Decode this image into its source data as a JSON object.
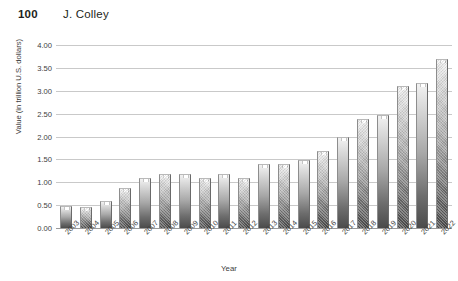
{
  "header": {
    "page_number": "100",
    "author": "J. Colley"
  },
  "chart_data": {
    "type": "bar",
    "title": "",
    "xlabel": "Year",
    "ylabel": "Value (in trillion U.S. dollars)",
    "categories": [
      "2003",
      "2004",
      "2005",
      "2006",
      "2007",
      "2008",
      "2009",
      "2010",
      "2011",
      "2012",
      "2013",
      "2014",
      "2015",
      "2016",
      "2017",
      "2018",
      "2019",
      "2020",
      "2021",
      "2022"
    ],
    "values": [
      0.48,
      0.47,
      0.58,
      0.88,
      1.09,
      1.19,
      1.19,
      1.09,
      1.19,
      1.09,
      1.39,
      1.39,
      1.48,
      1.68,
      1.98,
      2.38,
      2.48,
      3.11,
      3.18,
      3.69
    ],
    "ylim": [
      0,
      4.0
    ],
    "ytick_labels": [
      "4.00",
      "3.50",
      "3.00",
      "2.50",
      "2.00",
      "1.50",
      "1.00",
      "0.50",
      "0.00"
    ],
    "ytick_values": [
      4.0,
      3.5,
      3.0,
      2.5,
      2.0,
      1.5,
      1.0,
      0.5,
      0.0
    ],
    "grid": true,
    "legend": "none",
    "bar_fill": "grayscale-vertical-gradient",
    "colors": {
      "gridline": "#c9c9c9",
      "axis": "#9a9a9a",
      "bar_light": "#f2f2f2",
      "bar_dark": "#4b4b4b",
      "text": "#3d3d3d"
    }
  }
}
